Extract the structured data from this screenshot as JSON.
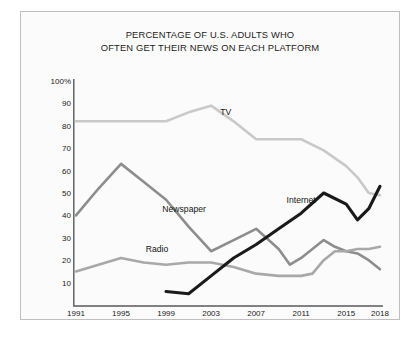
{
  "chart_data": {
    "type": "line",
    "title": "PERCENTAGE OF U.S. ADULTS WHO\nOFTEN GET THEIR NEWS ON EACH PLATFORM",
    "title_line1": "PERCENTAGE OF U.S. ADULTS WHO",
    "title_line2": "OFTEN GET THEIR NEWS ON EACH PLATFORM",
    "xlabel": "",
    "ylabel": "",
    "xlim": [
      1991,
      2018
    ],
    "ylim": [
      0,
      100
    ],
    "grid": false,
    "legend_position": "inline-labels",
    "xticks": [
      "1991",
      "1995",
      "1999",
      "2003",
      "2007",
      "2011",
      "2015",
      "2018"
    ],
    "xtick_values": [
      1991,
      1995,
      1999,
      2003,
      2007,
      2011,
      2015,
      2018
    ],
    "yticks": [
      "100%",
      "90",
      "80",
      "70",
      "60",
      "50",
      "40",
      "30",
      "20",
      "10"
    ],
    "ytick_values": [
      100,
      90,
      80,
      70,
      60,
      50,
      40,
      30,
      20,
      10
    ],
    "series": [
      {
        "name": "TV",
        "color": "#c9c9c9",
        "label_x": 2004.3,
        "label_y": 86,
        "x": [
          1991,
          1993,
          1995,
          1997,
          1999,
          2001,
          2003,
          2005,
          2007,
          2009,
          2011,
          2013,
          2015,
          2016,
          2017,
          2018
        ],
        "values": [
          82,
          82,
          82,
          82,
          82,
          86,
          89,
          82,
          74,
          74,
          74,
          69,
          62,
          57,
          50,
          49
        ]
      },
      {
        "name": "Newspaper",
        "color": "#8d8d8d",
        "label_x": 2000.6,
        "label_y": 43,
        "x": [
          1991,
          1993,
          1995,
          1997,
          1999,
          2001,
          2003,
          2005,
          2007,
          2009,
          2010,
          2011,
          2012,
          2013,
          2014,
          2015,
          2016,
          2017,
          2018
        ],
        "values": [
          40,
          52,
          63,
          55,
          47,
          35,
          24,
          29,
          34,
          25,
          18,
          21,
          25,
          29,
          26,
          24,
          23,
          20,
          16
        ]
      },
      {
        "name": "Radio",
        "color": "#a8a8a8",
        "label_x": 1998.2,
        "label_y": 25,
        "x": [
          1991,
          1993,
          1995,
          1997,
          1999,
          2001,
          2003,
          2005,
          2007,
          2009,
          2011,
          2012,
          2013,
          2014,
          2015,
          2016,
          2017,
          2018
        ],
        "values": [
          15,
          18,
          21,
          19,
          18,
          19,
          19,
          17,
          14,
          13,
          13,
          14,
          20,
          24,
          24,
          25,
          25,
          26
        ]
      },
      {
        "name": "Internet",
        "color": "#1a1a1a",
        "label_x": 2011.0,
        "label_y": 47,
        "x": [
          1999,
          2001,
          2003,
          2005,
          2007,
          2009,
          2011,
          2013,
          2015,
          2016,
          2017,
          2018
        ],
        "values": [
          6,
          5,
          13,
          21,
          27,
          34,
          41,
          50,
          45,
          38,
          43,
          53
        ]
      }
    ]
  },
  "axis": {
    "line_color": "#5a5a5a"
  }
}
